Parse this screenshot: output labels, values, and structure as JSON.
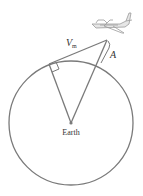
{
  "diagram": {
    "labels": {
      "tangent_line": "V",
      "tangent_sub": "m",
      "altitude": "A",
      "center": "Earth"
    },
    "colors": {
      "stroke": "#7a7a7a",
      "text": "#333333",
      "plane": "#9a9a9a"
    }
  }
}
